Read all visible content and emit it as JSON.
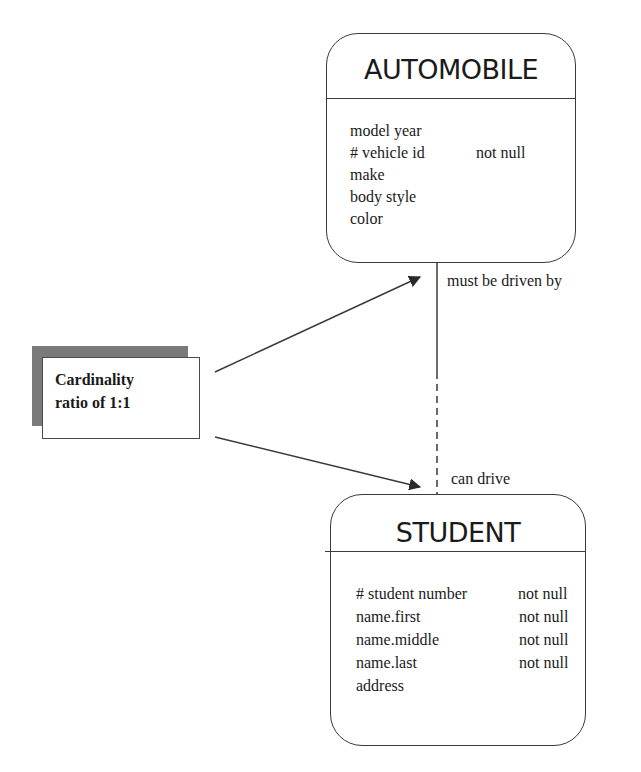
{
  "diagram": {
    "type": "entity-relationship",
    "entities": [
      {
        "id": "automobile",
        "title": "AUTOMOBILE",
        "attributes": [
          {
            "name": "model year",
            "constraint": ""
          },
          {
            "name": "# vehicle id",
            "constraint": "not null"
          },
          {
            "name": "make",
            "constraint": ""
          },
          {
            "name": "body style",
            "constraint": ""
          },
          {
            "name": "color",
            "constraint": ""
          }
        ]
      },
      {
        "id": "student",
        "title": "STUDENT",
        "attributes": [
          {
            "name": "# student number",
            "constraint": "not null"
          },
          {
            "name": "name.first",
            "constraint": "not null"
          },
          {
            "name": "name.middle",
            "constraint": "not null"
          },
          {
            "name": "name.last",
            "constraint": "not null"
          },
          {
            "name": "address",
            "constraint": ""
          }
        ]
      }
    ],
    "relationship": {
      "from_label": "must be driven by",
      "to_label": "can drive",
      "line_style_top": "solid",
      "line_style_bottom": "dashed"
    },
    "annotation": {
      "line1": "Cardinality",
      "line2": "ratio of 1:1"
    },
    "colors": {
      "stroke": "#3a3a3a",
      "text": "#1a1a1a",
      "shadow": "#7a7a7a",
      "background": "#ffffff"
    }
  }
}
